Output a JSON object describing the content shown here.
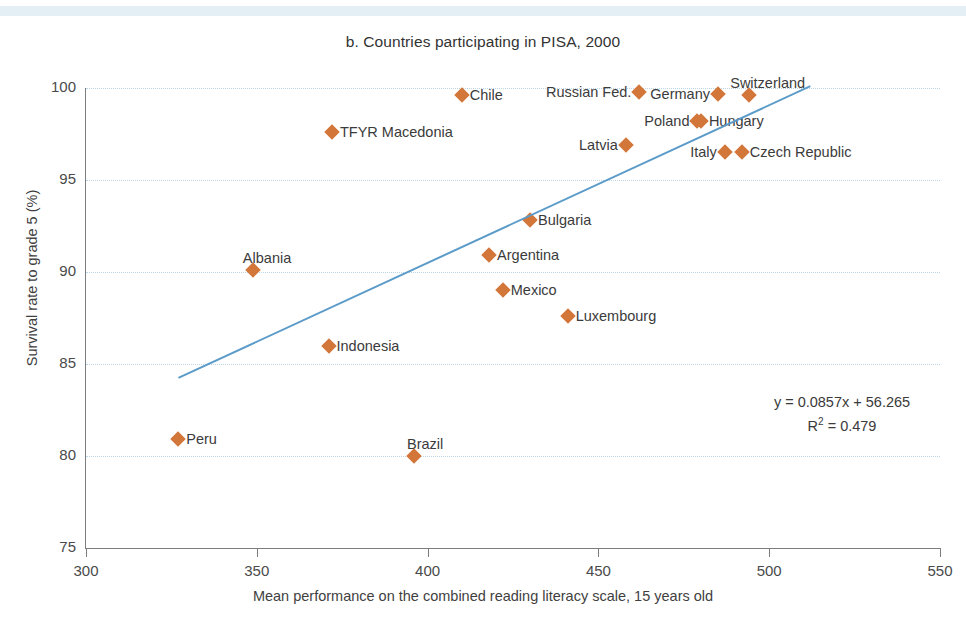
{
  "figure": {
    "title": "b. Countries participating in PISA, 2000",
    "band_color": "#e3eef5"
  },
  "chart_data": {
    "type": "scatter",
    "title": "b. Countries participating in PISA, 2000",
    "xlabel": "Mean performance on the combined reading literacy scale, 15 years old",
    "ylabel": "Survival rate to grade 5 (%)",
    "xlim": [
      300,
      550
    ],
    "ylim": [
      75,
      100
    ],
    "xticks": [
      300,
      350,
      400,
      450,
      500,
      550
    ],
    "yticks": [
      75,
      80,
      85,
      90,
      95,
      100
    ],
    "grid": "horizontal-dotted",
    "legend": "none",
    "marker": "diamond",
    "marker_color": "#d2763a",
    "trendline_color": "#5b9bc9",
    "annotation": {
      "equation": "y = 0.0857x + 56.265",
      "r2_prefix": "R",
      "r2_exponent": "2",
      "r2_value": " = 0.479"
    },
    "trendline": {
      "slope": 0.0857,
      "intercept": 56.265,
      "r2": 0.479,
      "x_start": 327,
      "x_end": 512
    },
    "points": [
      {
        "name": "Peru",
        "x": 327,
        "y": 80.9,
        "label_pos": "right"
      },
      {
        "name": "Albania",
        "x": 349,
        "y": 90.1,
        "label_pos": "above"
      },
      {
        "name": "TFYR Macedonia",
        "x": 372,
        "y": 97.6,
        "label_pos": "right"
      },
      {
        "name": "Indonesia",
        "x": 371,
        "y": 86.0,
        "label_pos": "right"
      },
      {
        "name": "Brazil",
        "x": 396,
        "y": 80.0,
        "label_pos": "above"
      },
      {
        "name": "Chile",
        "x": 410,
        "y": 99.6,
        "label_pos": "right"
      },
      {
        "name": "Argentina",
        "x": 418,
        "y": 90.9,
        "label_pos": "right"
      },
      {
        "name": "Mexico",
        "x": 422,
        "y": 89.0,
        "label_pos": "right"
      },
      {
        "name": "Bulgaria",
        "x": 430,
        "y": 92.8,
        "label_pos": "right"
      },
      {
        "name": "Luxembourg",
        "x": 441,
        "y": 87.6,
        "label_pos": "right"
      },
      {
        "name": "Russian Fed.",
        "x": 462,
        "y": 99.8,
        "label_pos": "left"
      },
      {
        "name": "Latvia",
        "x": 458,
        "y": 96.9,
        "label_pos": "left"
      },
      {
        "name": "Poland",
        "x": 479,
        "y": 98.2,
        "label_pos": "left"
      },
      {
        "name": "Hungary",
        "x": 480,
        "y": 98.2,
        "label_pos": "right"
      },
      {
        "name": "Germany",
        "x": 485,
        "y": 99.7,
        "label_pos": "left"
      },
      {
        "name": "Italy",
        "x": 487,
        "y": 96.5,
        "label_pos": "left"
      },
      {
        "name": "Czech Republic",
        "x": 492,
        "y": 96.5,
        "label_pos": "right"
      },
      {
        "name": "Switzerland",
        "x": 494,
        "y": 99.6,
        "label_pos": "above"
      }
    ]
  }
}
